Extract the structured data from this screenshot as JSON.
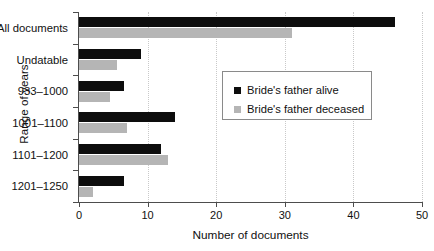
{
  "chart_data": {
    "type": "bar",
    "orientation": "horizontal",
    "title": "",
    "xlabel": "Number of documents",
    "ylabel": "Range of years",
    "categories": [
      "All documents",
      "Undatable",
      "933–1000",
      "1001–1100",
      "1101–1200",
      "1201–1250"
    ],
    "series": [
      {
        "name": "Bride's father alive",
        "color": "#0d0d0d",
        "values": [
          46,
          9,
          6.5,
          14,
          12,
          6.5
        ]
      },
      {
        "name": "Bride's father deceased",
        "color": "#b5b5b5",
        "values": [
          31,
          5.5,
          4.5,
          7,
          13,
          2
        ]
      }
    ],
    "xlim": [
      0,
      50
    ],
    "xticks": [
      0,
      10,
      20,
      30,
      40,
      50
    ],
    "xtick_labels": [
      "0",
      "10",
      "20",
      "30",
      "40",
      "50"
    ],
    "grid": "vertical-dotted",
    "legend_position": "center-right-inside"
  }
}
